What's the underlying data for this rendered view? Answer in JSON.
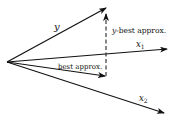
{
  "diagram": {
    "title": "",
    "vectors": [
      {
        "id": "y",
        "label": "y"
      },
      {
        "id": "x1",
        "label": "x",
        "subscript": "1"
      },
      {
        "id": "x2",
        "label": "x",
        "subscript": "2"
      },
      {
        "id": "best",
        "label": "best approx."
      }
    ],
    "residual": {
      "label_var": "y",
      "label_rest": "-best approx.",
      "style": "dashed"
    },
    "colors": {
      "ink": "#111111",
      "background": "#ffffff"
    }
  }
}
